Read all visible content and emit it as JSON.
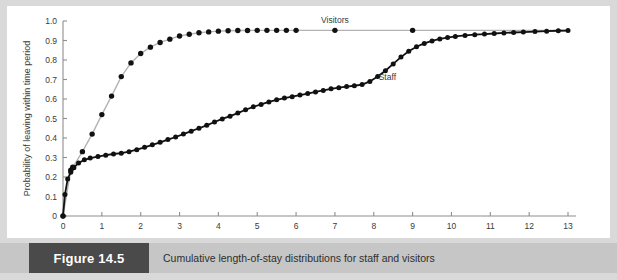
{
  "figure": {
    "number_label": "Figure 14.5",
    "caption": "Cumulative length-of-stay distributions for staff and visitors"
  },
  "colors": {
    "page_background": "#d9d9d9",
    "plot_background": "#ffffff",
    "caption_bar": "#c6c6c6",
    "figure_box": "#4a4a4a",
    "axis": "#8e8e8e",
    "visitors_line": "#b3b3b3",
    "staff_line": "#111111",
    "marker": "#111111"
  },
  "chart_data": {
    "type": "line",
    "title": "",
    "xlabel": "",
    "ylabel": "Probability of leaving within time period",
    "xlim": [
      0,
      13
    ],
    "ylim": [
      0,
      1.0
    ],
    "xticks": [
      0,
      1,
      2,
      3,
      4,
      5,
      6,
      7,
      8,
      9,
      10,
      11,
      12,
      13
    ],
    "xtick_labels": [
      "0",
      "1",
      "2",
      "3",
      "4",
      "5",
      "6",
      "7",
      "8",
      "9",
      "10",
      "11",
      "12",
      "13"
    ],
    "yticks": [
      0,
      0.1,
      0.2,
      0.3,
      0.4,
      0.5,
      0.6,
      0.7,
      0.8,
      0.9,
      1.0
    ],
    "ytick_labels": [
      "0",
      "0.1",
      "0.2",
      "0.3",
      "0.4",
      "0.5",
      "0.6",
      "0.7",
      "0.8",
      "0.9",
      "1.0"
    ],
    "grid": false,
    "legend_position": "inline-annotation",
    "annotations": [
      {
        "text": "Visitors",
        "x": 7.0,
        "y": 0.99
      },
      {
        "text": "Staff",
        "x": 8.35,
        "y": 0.7
      }
    ],
    "series": [
      {
        "name": "Visitors",
        "color": "#b3b3b3",
        "marker": "filled-circle",
        "points": [
          [
            0.0,
            0.0
          ],
          [
            0.2,
            0.235
          ],
          [
            0.25,
            0.25
          ],
          [
            0.5,
            0.33
          ],
          [
            0.75,
            0.42
          ],
          [
            1.0,
            0.52
          ],
          [
            1.25,
            0.615
          ],
          [
            1.5,
            0.715
          ],
          [
            1.75,
            0.785
          ],
          [
            2.0,
            0.833
          ],
          [
            2.25,
            0.866
          ],
          [
            2.5,
            0.89
          ],
          [
            2.75,
            0.907
          ],
          [
            3.0,
            0.923
          ],
          [
            3.25,
            0.932
          ],
          [
            3.5,
            0.94
          ],
          [
            3.75,
            0.944
          ],
          [
            4.0,
            0.948
          ],
          [
            4.25,
            0.95
          ],
          [
            4.5,
            0.951
          ],
          [
            4.75,
            0.951
          ],
          [
            5.0,
            0.952
          ],
          [
            5.25,
            0.952
          ],
          [
            5.5,
            0.952
          ],
          [
            5.75,
            0.952
          ],
          [
            6.0,
            0.952
          ],
          [
            7.0,
            0.952
          ],
          [
            9.0,
            0.952
          ],
          [
            13.0,
            0.952
          ]
        ]
      },
      {
        "name": "Staff",
        "color": "#111111",
        "marker": "filled-circle",
        "points": [
          [
            0.0,
            0.0
          ],
          [
            0.05,
            0.11
          ],
          [
            0.12,
            0.19
          ],
          [
            0.2,
            0.225
          ],
          [
            0.28,
            0.248
          ],
          [
            0.4,
            0.272
          ],
          [
            0.55,
            0.288
          ],
          [
            0.7,
            0.297
          ],
          [
            0.9,
            0.305
          ],
          [
            1.1,
            0.312
          ],
          [
            1.3,
            0.318
          ],
          [
            1.5,
            0.322
          ],
          [
            1.7,
            0.33
          ],
          [
            1.9,
            0.34
          ],
          [
            2.1,
            0.352
          ],
          [
            2.3,
            0.365
          ],
          [
            2.5,
            0.378
          ],
          [
            2.7,
            0.392
          ],
          [
            2.9,
            0.405
          ],
          [
            3.1,
            0.42
          ],
          [
            3.3,
            0.435
          ],
          [
            3.5,
            0.45
          ],
          [
            3.7,
            0.465
          ],
          [
            3.9,
            0.482
          ],
          [
            4.1,
            0.498
          ],
          [
            4.3,
            0.512
          ],
          [
            4.5,
            0.528
          ],
          [
            4.7,
            0.545
          ],
          [
            4.9,
            0.56
          ],
          [
            5.1,
            0.572
          ],
          [
            5.3,
            0.585
          ],
          [
            5.5,
            0.596
          ],
          [
            5.7,
            0.605
          ],
          [
            5.9,
            0.612
          ],
          [
            6.1,
            0.62
          ],
          [
            6.3,
            0.628
          ],
          [
            6.5,
            0.636
          ],
          [
            6.7,
            0.644
          ],
          [
            6.9,
            0.652
          ],
          [
            7.1,
            0.658
          ],
          [
            7.3,
            0.664
          ],
          [
            7.5,
            0.668
          ],
          [
            7.7,
            0.674
          ],
          [
            7.9,
            0.69
          ],
          [
            8.1,
            0.715
          ],
          [
            8.3,
            0.745
          ],
          [
            8.5,
            0.78
          ],
          [
            8.7,
            0.815
          ],
          [
            8.9,
            0.845
          ],
          [
            9.1,
            0.868
          ],
          [
            9.3,
            0.885
          ],
          [
            9.5,
            0.898
          ],
          [
            9.7,
            0.908
          ],
          [
            9.9,
            0.915
          ],
          [
            10.1,
            0.921
          ],
          [
            10.35,
            0.926
          ],
          [
            10.6,
            0.93
          ],
          [
            10.85,
            0.933
          ],
          [
            11.1,
            0.936
          ],
          [
            11.35,
            0.939
          ],
          [
            11.6,
            0.941
          ],
          [
            11.85,
            0.943
          ],
          [
            12.15,
            0.946
          ],
          [
            12.45,
            0.948
          ],
          [
            12.75,
            0.95
          ],
          [
            13.0,
            0.951
          ]
        ]
      }
    ]
  }
}
